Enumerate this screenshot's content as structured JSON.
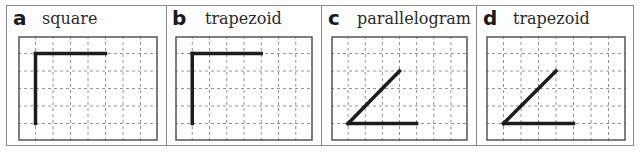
{
  "panels": [
    {
      "letter": "a",
      "name": "square",
      "shape": "right-angle",
      "segments": [
        [
          1,
          1,
          1,
          5
        ],
        [
          1,
          1,
          5,
          1
        ]
      ]
    },
    {
      "letter": "b",
      "name": "trapezoid",
      "shape": "right-angle",
      "segments": [
        [
          1,
          1,
          1,
          5
        ],
        [
          1,
          1,
          5,
          1
        ]
      ]
    },
    {
      "letter": "c",
      "name": "parallelogram",
      "shape": "acute-angle",
      "segments": [
        [
          1,
          5,
          4,
          2
        ],
        [
          1,
          5,
          5,
          5
        ]
      ]
    },
    {
      "letter": "d",
      "name": "trapezoid",
      "shape": "acute-angle",
      "segments": [
        [
          1,
          5,
          4,
          2
        ],
        [
          1,
          5,
          5,
          5
        ]
      ]
    }
  ],
  "grid": {
    "columns": 8,
    "rows": 6,
    "line_color": "#7a7a7a",
    "stroke_color": "#1c1c1c",
    "frame_color": "#555555"
  }
}
